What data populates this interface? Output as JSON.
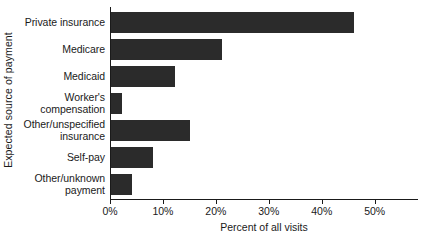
{
  "chart_data": {
    "type": "bar",
    "orientation": "horizontal",
    "title": "",
    "xlabel": "Percent of all visits",
    "ylabel": "Expected source of payment",
    "categories": [
      "Private insurance",
      "Medicare",
      "Medicaid",
      "Worker's compensation",
      "Other/unspecified insurance",
      "Self-pay",
      "Other/unknown payment"
    ],
    "category_lines": [
      [
        "Private insurance"
      ],
      [
        "Medicare"
      ],
      [
        "Medicaid"
      ],
      [
        "Worker's",
        "compensation"
      ],
      [
        "Other/unspecified",
        "insurance"
      ],
      [
        "Self-pay"
      ],
      [
        "Other/unknown",
        "payment"
      ]
    ],
    "values": [
      46,
      21,
      12,
      2,
      15,
      8,
      4
    ],
    "xlim": [
      0,
      58
    ],
    "xticks": [
      0,
      10,
      20,
      30,
      40,
      50
    ],
    "xticklabels": [
      "0%",
      "10%",
      "20%",
      "30%",
      "40%",
      "50%"
    ],
    "grid": false,
    "legend": null,
    "bar_color": "#2b2b2b",
    "axis_color": "#1a1a1a",
    "background_color": "#ffffff"
  }
}
